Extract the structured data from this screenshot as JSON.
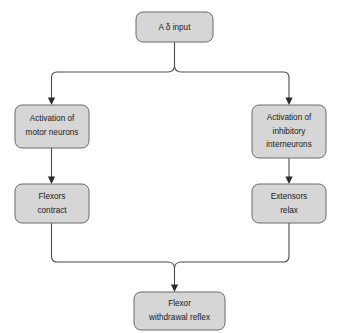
{
  "diagram": {
    "background_color": "#ffffff",
    "node_fill_color": "#d6d6d6",
    "node_border_color": "#6a6a6a",
    "connector_color": "#4a4a4a",
    "text_color": "#1a1a1a",
    "nodes": {
      "input": {
        "line1": "A δ input"
      },
      "motor": {
        "line1": "Activation of",
        "line2": "motor neurons"
      },
      "inhibitory": {
        "line1": "Activation of",
        "line2": "inhibitory",
        "line3": "interneurons"
      },
      "flexors": {
        "line1": "Flexors",
        "line2": "contract"
      },
      "extensors": {
        "line1": "Extensors",
        "line2": "relax"
      },
      "reflex": {
        "line1": "Flexor",
        "line2": "withdrawal reflex"
      }
    },
    "edges": [
      {
        "name": "input-to-motor",
        "from": "input",
        "to": "motor"
      },
      {
        "name": "input-to-inhibitory",
        "from": "input",
        "to": "inhibitory"
      },
      {
        "name": "motor-to-flexors",
        "from": "motor",
        "to": "flexors"
      },
      {
        "name": "inhibitory-to-extensors",
        "from": "inhibitory",
        "to": "extensors"
      },
      {
        "name": "flexors-to-reflex",
        "from": "flexors",
        "to": "reflex"
      },
      {
        "name": "extensors-to-reflex",
        "from": "extensors",
        "to": "reflex"
      }
    ]
  }
}
